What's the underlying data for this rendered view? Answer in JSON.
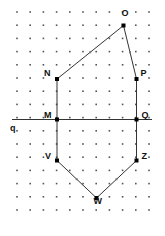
{
  "figure": {
    "width": 165,
    "height": 236,
    "background": "#ffffff",
    "ink_color": "#333333",
    "dot_color": "#555555",
    "label_color": "#111111"
  },
  "grid": {
    "origin_x": 17,
    "origin_y": 12,
    "step_x": 13.2,
    "step_y": 13.2,
    "cols": 11,
    "rows": 16,
    "dot_size": 1.6
  },
  "axis": {
    "label": "q",
    "label_x": 10,
    "label_y": 124,
    "y": 119.5,
    "x_start": 12,
    "x_end": 152
  },
  "vertices": [
    {
      "name": "O",
      "x": 123.5,
      "y": 25.5,
      "label": "O",
      "label_dx": -2,
      "label_dy": -12
    },
    {
      "name": "N",
      "x": 57.0,
      "y": 79.0,
      "label": "N",
      "label_dx": -13,
      "label_dy": -5
    },
    {
      "name": "P",
      "x": 136.5,
      "y": 79.0,
      "label": "P",
      "label_dx": 4,
      "label_dy": -5
    },
    {
      "name": "M",
      "x": 57.0,
      "y": 119.5,
      "label": "M",
      "label_dx": -13,
      "label_dy": -4
    },
    {
      "name": "Q",
      "x": 136.5,
      "y": 119.5,
      "label": "Q",
      "label_dx": 5,
      "label_dy": -4
    },
    {
      "name": "V",
      "x": 57.0,
      "y": 160.5,
      "label": "V",
      "label_dx": -12,
      "label_dy": -4
    },
    {
      "name": "Z",
      "x": 136.5,
      "y": 160.5,
      "label": "Z",
      "label_dx": 5,
      "label_dy": -4
    },
    {
      "name": "W",
      "x": 96.5,
      "y": 198.0,
      "label": "W",
      "label_dx": -3,
      "label_dy": 4
    }
  ],
  "edges": [
    {
      "from": "N",
      "to": "O"
    },
    {
      "from": "O",
      "to": "P"
    },
    {
      "from": "P",
      "to": "Q"
    },
    {
      "from": "N",
      "to": "M"
    },
    {
      "from": "M",
      "to": "V"
    },
    {
      "from": "Q",
      "to": "Z"
    },
    {
      "from": "V",
      "to": "W"
    },
    {
      "from": "W",
      "to": "Z"
    }
  ],
  "midpoint_ticks": [
    {
      "on": "N-O",
      "x": 90.2,
      "y": 52.2
    },
    {
      "on": "O-P",
      "x": 130.0,
      "y": 52.2
    },
    {
      "on": "V-W",
      "x": 76.7,
      "y": 179.2
    },
    {
      "on": "W-Z",
      "x": 116.5,
      "y": 179.2
    }
  ]
}
